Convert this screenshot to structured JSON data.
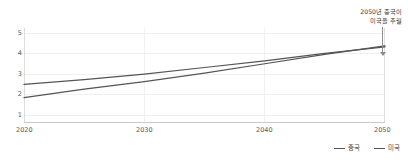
{
  "chart_data": {
    "type": "line",
    "title": "",
    "xlabel": "",
    "ylabel": "",
    "xlim": [
      2020,
      2050
    ],
    "ylim": [
      0,
      5
    ],
    "grid": true,
    "legend_position": "bottom-right",
    "x_ticks": [
      "2020",
      "2030",
      "2040",
      "2050"
    ],
    "y_ticks": [
      "1",
      "2",
      "3",
      "4",
      "5"
    ],
    "x": [
      2020,
      2025,
      2030,
      2035,
      2040,
      2045,
      2050
    ],
    "series": [
      {
        "name": "중국",
        "color": "#555555",
        "values": [
          1.3,
          1.75,
          2.15,
          2.6,
          3.1,
          3.6,
          4.05
        ]
      },
      {
        "name": "미국",
        "color": "#555555",
        "values": [
          2.0,
          2.25,
          2.55,
          2.9,
          3.25,
          3.65,
          4.0
        ]
      }
    ],
    "annotations": [
      {
        "name": "crossover-callout",
        "line1": "2050년 중국이",
        "line2": "미국을 추월",
        "target_x": 2050,
        "target_y": 4.05
      }
    ]
  },
  "legend": {
    "items": [
      {
        "label": "중국",
        "color": "#555555"
      },
      {
        "label": "미국",
        "color": "#555555"
      }
    ]
  },
  "axes": {
    "y_ticks": [
      "5",
      "4",
      "3",
      "2",
      "1"
    ],
    "x_ticks": [
      "2020",
      "2030",
      "2040",
      "2050"
    ]
  },
  "colors": {
    "background": "#ffffff",
    "grid": "#f0f0f0",
    "axis": "#c9c9c9",
    "text": "#5a5a5a",
    "series": "#555555",
    "annotation": "#3a3a3a"
  }
}
